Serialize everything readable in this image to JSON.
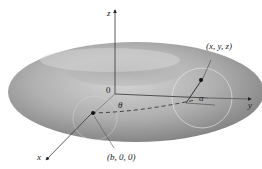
{
  "figure": {
    "type": "torus-diagram",
    "axes": {
      "x": "x",
      "y": "y",
      "z": "z",
      "origin": "0"
    },
    "labels": {
      "point_surface": "(x, y, z)",
      "point_center": "(b, 0, 0)",
      "angle_theta": "θ",
      "angle_alpha": "α"
    },
    "colors": {
      "torus_light": "#c8c8c8",
      "torus_dark": "#7a7a7a",
      "axis": "#333333",
      "background": "#ffffff"
    }
  }
}
